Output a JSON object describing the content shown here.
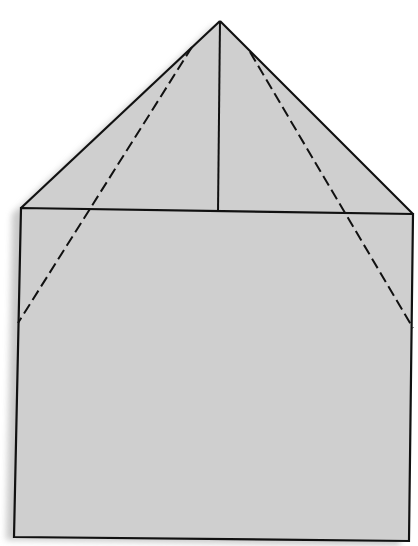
{
  "diagram": {
    "colors": {
      "background": "#ffffff",
      "fill": "#cfcfcf",
      "shadow": "#a9a9a9",
      "stroke": "#111111"
    },
    "points": {
      "apex": [
        220,
        21
      ],
      "rect_top_left": [
        21,
        208
      ],
      "rect_top_right": [
        413,
        214
      ],
      "rect_bottom_left": [
        14,
        537
      ],
      "rect_bottom_right": [
        409,
        541
      ],
      "center_foot": [
        218,
        212
      ],
      "left_dash_start": [
        192,
        47
      ],
      "left_dash_end": [
        18,
        323
      ],
      "right_dash_start": [
        250,
        52
      ],
      "right_dash_end": [
        413,
        328
      ]
    }
  }
}
